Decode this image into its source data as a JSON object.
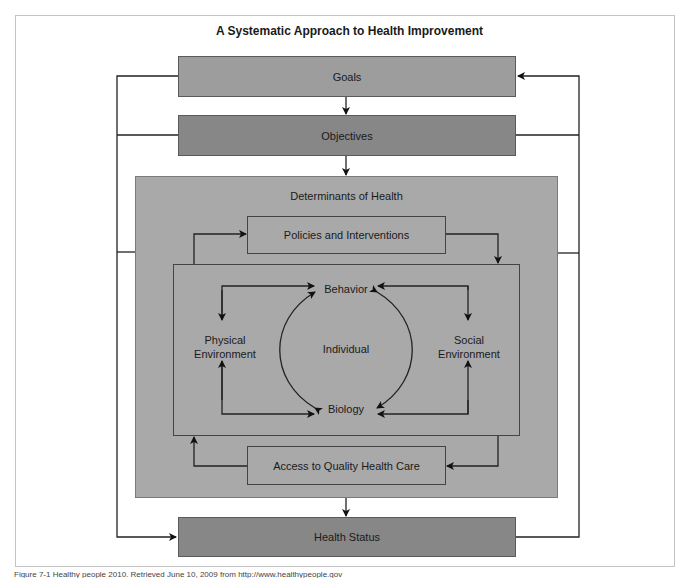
{
  "title": "A Systematic Approach to Health Improvement",
  "nodes": {
    "goals": "Goals",
    "objectives": "Objectives",
    "determinants": "Determinants of Health",
    "policies": "Policies and Interventions",
    "behavior": "Behavior",
    "physical_env_line1": "Physical",
    "physical_env_line2": "Environment",
    "individual": "Individual",
    "social_env_line1": "Social",
    "social_env_line2": "Environment",
    "biology": "Biology",
    "access": "Access to Quality Health Care",
    "health_status": "Health Status"
  },
  "edges": [
    {
      "from": "Goals",
      "to": "Objectives"
    },
    {
      "from": "Objectives",
      "to": "Determinants of Health"
    },
    {
      "from": "Determinants of Health",
      "to": "Health Status"
    },
    {
      "from": "Goals/Objectives/Determinants (left feedback)",
      "to": "Health Status"
    },
    {
      "from": "Health Status/Objectives/Determinants (right feedback)",
      "to": "Goals"
    },
    {
      "from": "Individual (inner box)",
      "to": "Policies and Interventions"
    },
    {
      "from": "Policies and Interventions",
      "to": "Individual (inner box)"
    },
    {
      "from": "Individual (inner box)",
      "to": "Access to Quality Health Care"
    },
    {
      "from": "Access to Quality Health Care",
      "to": "Individual (inner box)"
    },
    {
      "from": "Behavior",
      "to": "Physical Environment",
      "bidirectional": true
    },
    {
      "from": "Behavior",
      "to": "Social Environment",
      "bidirectional": true
    },
    {
      "from": "Biology",
      "to": "Physical Environment",
      "bidirectional": true
    },
    {
      "from": "Biology",
      "to": "Social Environment",
      "bidirectional": true
    },
    {
      "from": "Behavior",
      "to": "Biology",
      "bidirectional": true
    }
  ],
  "caption": "Figure 7-1 Healthy people 2010. Retrieved June 10, 2009 from http://www.healthypeople.gov"
}
